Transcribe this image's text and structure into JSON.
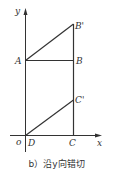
{
  "figure": {
    "caption": "b）沿y向错切",
    "axes": {
      "x_label": "x",
      "y_label": "y",
      "origin_label": "o"
    },
    "points": {
      "A": "A",
      "B": "B",
      "B_prime": "B'",
      "C": "C",
      "C_prime": "C'",
      "D": "D"
    },
    "colors": {
      "line": "#333333",
      "background": "#ffffff"
    }
  }
}
